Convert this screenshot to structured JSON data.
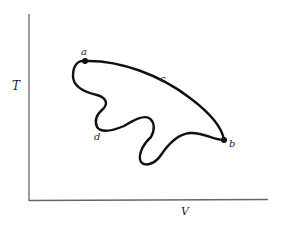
{
  "diagram": {
    "type": "thermodynamic-path-diagram",
    "axes": {
      "y_label": "T",
      "x_label": "V"
    },
    "points": [
      {
        "id": "a",
        "label": "a"
      },
      {
        "id": "b",
        "label": "b"
      }
    ],
    "paths": [
      {
        "id": "c",
        "label": "c",
        "from": "a",
        "to": "b",
        "shape": "smooth arc"
      },
      {
        "id": "d",
        "label": "d",
        "from": "a",
        "to": "b",
        "shape": "wiggly"
      }
    ],
    "colors": {
      "axis": "#555555",
      "curve": "#111111",
      "background": "#ffffff"
    }
  }
}
